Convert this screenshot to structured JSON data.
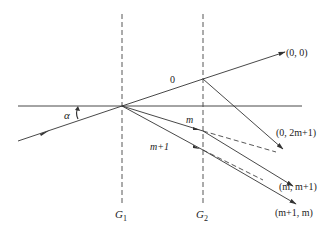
{
  "diagram": {
    "type": "double-grating diffraction ray diagram",
    "gratings": [
      {
        "id": "G1",
        "label_main": "G",
        "label_sub": "1",
        "x": 122
      },
      {
        "id": "G2",
        "label_main": "G",
        "label_sub": "2",
        "x": 203
      }
    ],
    "angle_label": "α",
    "ray_labels": {
      "zero": "0",
      "m": "m",
      "m_plus_1": "m+1"
    },
    "output_labels": [
      {
        "id": "out-0-0",
        "text": "(0, 0)"
      },
      {
        "id": "out-0-2m1",
        "text": "(0, 2m+1)"
      },
      {
        "id": "out-m-m1",
        "text": "(m, m+1)"
      },
      {
        "id": "out-m1-m",
        "text": "(m+1, m)"
      }
    ],
    "colors": {
      "line": "#333333",
      "background": "#ffffff"
    }
  }
}
